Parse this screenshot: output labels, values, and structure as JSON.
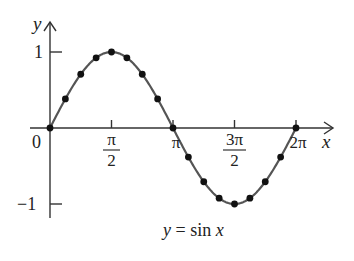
{
  "chart_data": {
    "type": "line",
    "title": "y = sin x",
    "xlabel": "x",
    "ylabel": "y",
    "x_ticks": [
      {
        "value": 0,
        "label": "0"
      },
      {
        "value": 1.5708,
        "label": "π/2",
        "num": "π",
        "den": "2"
      },
      {
        "value": 3.1416,
        "label": "π"
      },
      {
        "value": 4.7124,
        "label": "3π/2",
        "num": "3π",
        "den": "2"
      },
      {
        "value": 6.2832,
        "label": "2π"
      }
    ],
    "y_ticks": [
      {
        "value": 1,
        "label": "1"
      },
      {
        "value": -1,
        "label": "−1"
      }
    ],
    "xlim": [
      0,
      6.2832
    ],
    "ylim": [
      -1,
      1
    ],
    "grid": false,
    "series": [
      {
        "name": "sin x",
        "x": [
          0,
          0.3927,
          0.7854,
          1.1781,
          1.5708,
          1.9635,
          2.3562,
          2.7489,
          3.1416,
          3.5343,
          3.927,
          4.3197,
          4.7124,
          5.1051,
          5.4978,
          5.8905,
          6.2832
        ],
        "y": [
          0,
          0.383,
          0.707,
          0.924,
          1,
          0.924,
          0.707,
          0.383,
          0,
          -0.383,
          -0.707,
          -0.924,
          -1,
          -0.924,
          -0.707,
          -0.383,
          0
        ],
        "markers": true
      }
    ],
    "colors": {
      "curve": "#555555",
      "markers": "#111111",
      "axes": "#333333"
    }
  },
  "labels": {
    "y_axis": "y",
    "x_axis": "x",
    "origin": "0",
    "y_one": "1",
    "y_neg_one": "−1",
    "pi_half_num": "π",
    "pi_half_den": "2",
    "pi": "π",
    "three_pi_half_num": "3π",
    "three_pi_half_den": "2",
    "two_pi": "2π",
    "caption_y": "y",
    "caption_eq": " = sin ",
    "caption_x": "x"
  }
}
